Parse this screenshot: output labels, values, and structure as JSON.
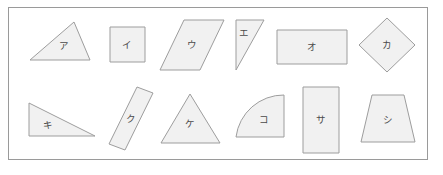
{
  "page": {
    "background_color": "#ffffff",
    "frame_border_color": "#9a9a9a"
  },
  "style": {
    "shape_fill": "#f1f1f1",
    "shape_stroke": "#9d9d9d",
    "label_color": "#4a4a4a"
  },
  "shapes": [
    {
      "id": "a",
      "label": "ア",
      "kind": "scalene-triangle",
      "row": 1,
      "points": "30,60 74,22 90,60",
      "label_x": 64,
      "label_y": 46
    },
    {
      "id": "i",
      "label": "イ",
      "kind": "square",
      "row": 1,
      "points": "110,27 145,27 145,62 110,62",
      "label_x": 127,
      "label_y": 45
    },
    {
      "id": "u",
      "label": "ウ",
      "kind": "parallelogram",
      "row": 1,
      "points": "184,20 224,20 200,70 160,70",
      "label_x": 192,
      "label_y": 45
    },
    {
      "id": "e",
      "label": "エ",
      "kind": "right-triangle",
      "row": 1,
      "points": "236,20 264,20 236,70",
      "label_x": 244,
      "label_y": 33
    },
    {
      "id": "o",
      "label": "オ",
      "kind": "rectangle",
      "row": 1,
      "points": "277,30 347,30 347,64 277,64",
      "label_x": 312,
      "label_y": 47
    },
    {
      "id": "ka",
      "label": "カ",
      "kind": "diamond",
      "row": 1,
      "points": "387,18 415,45 387,72 359,45",
      "label_x": 387,
      "label_y": 45
    },
    {
      "id": "ki",
      "label": "キ",
      "kind": "right-triangle",
      "row": 2,
      "points": "29,103 95,136 29,136",
      "label_x": 48,
      "label_y": 125
    },
    {
      "id": "ku",
      "label": "ク",
      "kind": "rotated-rectangle",
      "row": 2,
      "points": "137,87 153,93 125,150 109,144",
      "label_x": 131,
      "label_y": 119
    },
    {
      "id": "ke",
      "label": "ケ",
      "kind": "isosceles-triangle",
      "row": 2,
      "points": "190,94 220,143 161,143",
      "label_x": 190,
      "label_y": 124
    },
    {
      "id": "ko",
      "label": "コ",
      "kind": "quarter-circle",
      "row": 2,
      "arc": "M 236,137 A 48,48 0 0 1 284,95 L 284,137 Z",
      "label_x": 264,
      "label_y": 120
    },
    {
      "id": "sa",
      "label": "サ",
      "kind": "vertical-rectangle",
      "row": 2,
      "points": "303,87 339,87 339,153 303,153",
      "label_x": 321,
      "label_y": 120
    },
    {
      "id": "shi",
      "label": "シ",
      "kind": "trapezoid",
      "row": 2,
      "points": "372,95 404,95 415,142 361,142",
      "label_x": 388,
      "label_y": 120
    }
  ]
}
